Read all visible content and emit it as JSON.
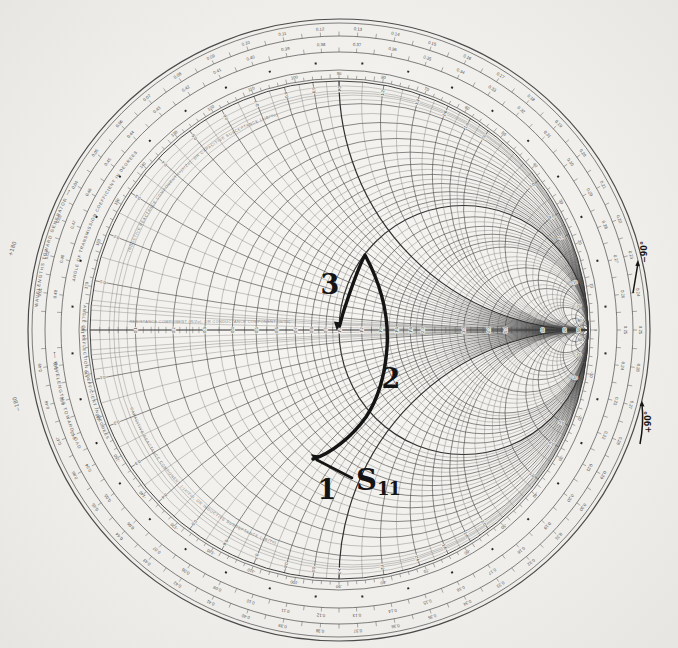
{
  "figure": {
    "background": "#f1f0ec",
    "print_ink": "#4a4a4a",
    "fine_ink": "#6e6e6e",
    "bold_ink": "#2f2f2f",
    "annotation_ink": "#141414"
  },
  "chart": {
    "type": "smith-chart",
    "center": {
      "x": 339,
      "y": 330
    },
    "grid_radius": 249,
    "ring_radii": [
      311,
      307,
      294,
      278,
      260,
      251.5
    ],
    "resistance_values_main": [
      0.1,
      0.2,
      0.3,
      0.4,
      0.5,
      0.6,
      0.7,
      0.8,
      0.9,
      1.0,
      1.2,
      1.4,
      1.6,
      1.8,
      2.0,
      3,
      4,
      5,
      10,
      20,
      50
    ],
    "resistance_values_fine": [
      0.05,
      0.15,
      0.25,
      0.35,
      0.45,
      0.55,
      0.65,
      0.75,
      0.85,
      0.95,
      1.1,
      1.3,
      1.5,
      1.7,
      1.9,
      2.2,
      2.4,
      2.6,
      2.8,
      3.5,
      4.5,
      6,
      7,
      8,
      9,
      15,
      30,
      40
    ],
    "resistance_values_extra": [
      0.02,
      0.04,
      0.06,
      0.08
    ],
    "reactance_values_main": [
      0.1,
      0.2,
      0.3,
      0.4,
      0.5,
      0.6,
      0.7,
      0.8,
      0.9,
      1.0,
      1.2,
      1.4,
      1.6,
      1.8,
      2.0,
      3,
      4,
      5,
      10,
      20,
      50
    ],
    "reactance_values_fine": [
      0.05,
      0.15,
      0.25,
      0.35,
      0.45,
      0.55,
      0.65,
      0.75,
      0.85,
      0.95,
      1.1,
      1.3,
      1.5,
      1.7,
      1.9,
      2.2,
      2.4,
      2.6,
      2.8,
      3.5,
      4.5,
      6,
      7,
      8,
      9,
      15,
      30,
      40
    ],
    "reactance_values_extra": [
      0.02,
      0.04,
      0.06,
      0.08
    ],
    "axis_labels": [
      "0.1",
      "0.2",
      "0.3",
      "0.4",
      "0.5",
      "0.6",
      "0.7",
      "0.8",
      "0.9",
      "1.0",
      "1.2",
      "1.4",
      "1.6",
      "1.8",
      "2.0",
      "3.0",
      "4.0",
      "5.0",
      "10",
      "20",
      "50"
    ],
    "rim_reactance_labels": [
      "0.1",
      "0.2",
      "0.3",
      "0.4",
      "0.5",
      "0.6",
      "0.7",
      "0.8",
      "0.9",
      "1.0",
      "1.2",
      "1.4",
      "1.6",
      "1.8",
      "2.0",
      "3.0",
      "4.0",
      "5.0",
      "10",
      "20",
      "50"
    ],
    "scales": {
      "toward_generator": {
        "title": "WAVELENGTHS TOWARD GENERATOR ⟶",
        "from": 0.01,
        "to": 0.49,
        "step": 0.01,
        "label_radius": 301.5,
        "tick_r0": 294,
        "tick_r1": 298,
        "tick_r1_major": 296.5
      },
      "toward_load": {
        "title": "⟵ WAVELENGTHS TOWARD LOAD",
        "from": 0.01,
        "to": 0.49,
        "step": 0.01,
        "label_radius": 286,
        "tick_r0": 278,
        "tick_r1": 282,
        "tick_r1_major": 280.5
      },
      "angle_reflection": {
        "title": "ANGLE OF REFLECTION COEFFICIENT IN DEGREES",
        "from": -170,
        "to": 180,
        "step": 10,
        "label_radius": 256.5,
        "tick_r0": 251.5,
        "tick_r1": 254.8,
        "tick_r1_major": 253.5
      },
      "angle_transmission": {
        "title": "ANGLE OF TRANSMISSION COEFFICIENT IN DEGREES",
        "square_radius": 267.5,
        "square_step_deg": 10
      }
    },
    "inner_titles": {
      "upper": "INDUCTIVE REACTANCE COMPONENT (+jX/Zo), OR CAPACITIVE SUSCEPTANCE (+jB/Yo)",
      "lower": "CAPACITIVE REACTANCE COMPONENT (-jX/Zo), OR INDUCTIVE SUSCEPTANCE (-jB/Yo)",
      "axis": "RESISTANCE COMPONENT (R/Zo), OR CONDUCTANCE COMPONENT (G/Yo)"
    }
  },
  "trace": {
    "path": "M 313 459 C 330 454, 352 437, 366 417 C 378 399, 385 375, 387 348 C 389 318, 383 288, 365 255 C 357 270, 349 295, 344 310 C 342 316, 341 321, 339.5 326",
    "end_arrowhead": "336.8,330.5 341.2,322.4 334.0,321.6",
    "leader_line": {
      "x1": 352,
      "y1": 478,
      "x2": 317,
      "y2": 460
    },
    "leader_arrowhead": "310.5,454.3 319.5,455.4 316.5,461.6",
    "point3_label_pos": {
      "x": 330,
      "y": 284
    },
    "point2_label_pos": {
      "x": 391,
      "y": 378
    },
    "point1_label_pos": {
      "x": 327,
      "y": 489
    },
    "s11_label_pos": {
      "x": 356,
      "y": 466
    }
  },
  "annotations": {
    "point1": "1",
    "point2": "2",
    "point3": "3",
    "trace_label_main": "S",
    "trace_label_sub": "11",
    "rim_notes": [
      {
        "id": "top-right",
        "text": "−90°",
        "x": 645,
        "y": 252,
        "rot": -90,
        "style": "bold",
        "arrow": "M 633 293 Q 636 275 638 263",
        "head": "638,260 640,266.2 635.3,265.7"
      },
      {
        "id": "bottom-right",
        "text": "+90°",
        "x": 649,
        "y": 422,
        "rot": -90,
        "style": "bold",
        "arrow": "M 640 444 Q 644 424 642 404",
        "head": "642,401 644.5,406.5 639.6,406"
      },
      {
        "id": "top-left",
        "text": "+180",
        "x": 13,
        "y": 249,
        "rot": -72,
        "style": "light",
        "arrow": "",
        "head": ""
      },
      {
        "id": "bottom-left",
        "text": "−180",
        "x": 17,
        "y": 404,
        "rot": -108,
        "style": "light",
        "arrow": "",
        "head": ""
      }
    ]
  },
  "chart_data": {
    "type": "line",
    "series": [
      {
        "name": "S11",
        "points_gamma": [
          {
            "label": "1",
            "re": -0.1,
            "im": -0.52
          },
          {
            "label": "2",
            "re": 0.19,
            "im": -0.19
          },
          {
            "label": "",
            "re": 0.1,
            "im": 0.3
          },
          {
            "label": "3",
            "re": 0.0,
            "im": 0.0
          }
        ]
      }
    ],
    "xlabel": "Re(Γ)",
    "ylabel": "Im(Γ)"
  }
}
